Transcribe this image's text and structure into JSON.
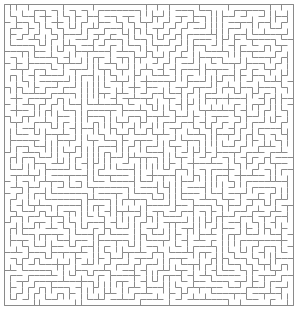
{
  "figure": {
    "kind": "maze-puzzle"
  },
  "canvas": {
    "width": 301,
    "height": 312,
    "background_color": "#ffffff"
  },
  "maze": {
    "columns": 49,
    "rows": 51,
    "cell_size": 5.9,
    "origin_x": 4,
    "origin_y": 4,
    "wall_color": "#8a8a8a",
    "wall_thickness": 1,
    "border": true,
    "border_color": "#8a8a8a",
    "passage_color": "#ffffff",
    "algorithm_seed": 20240517,
    "entrance": null,
    "exit": null,
    "solution_shown": false
  }
}
